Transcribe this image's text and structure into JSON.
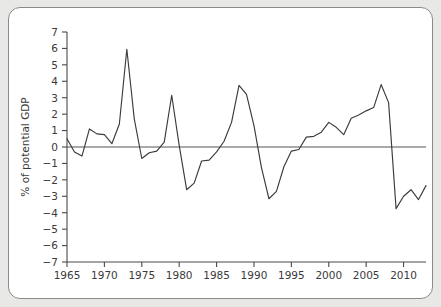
{
  "chart_data": {
    "type": "line",
    "title": "",
    "subtitle": "",
    "xlabel": "",
    "ylabel": "% of potential GDP",
    "xlim": [
      1965,
      2013
    ],
    "ylim": [
      -7,
      7
    ],
    "grid": false,
    "legend_position": "none",
    "annotations": [],
    "y_ticks": [
      7,
      6,
      5,
      4,
      3,
      2,
      1,
      0,
      -1,
      -2,
      -3,
      -4,
      -5,
      -6,
      -7
    ],
    "y_tick_labels": [
      "7",
      "6",
      "5",
      "4",
      "3",
      "2",
      "1",
      "0",
      "−1",
      "−2",
      "−3",
      "−4",
      "−5",
      "−6",
      "−7"
    ],
    "x_ticks": [
      1965,
      1970,
      1975,
      1980,
      1985,
      1990,
      1995,
      2000,
      2005,
      2010
    ],
    "x_tick_labels": [
      "1965",
      "1970",
      "1975",
      "1980",
      "1985",
      "1990",
      "1995",
      "2000",
      "2005",
      "2010"
    ],
    "x_minor_ticks": [],
    "series": [
      {
        "name": "Output gap",
        "color": "#3b3b3b",
        "x": [
          1965,
          1966,
          1967,
          1968,
          1969,
          1970,
          1971,
          1972,
          1973,
          1974,
          1975,
          1976,
          1977,
          1978,
          1979,
          1980,
          1981,
          1982,
          1983,
          1984,
          1985,
          1986,
          1987,
          1988,
          1989,
          1990,
          1991,
          1992,
          1993,
          1994,
          1995,
          1996,
          1997,
          1998,
          1999,
          2000,
          2001,
          2002,
          2003,
          2004,
          2005,
          2006,
          2007,
          2008,
          2009,
          2010,
          2011,
          2012,
          2013
        ],
        "values": [
          0.5,
          -0.3,
          -0.55,
          1.1,
          0.8,
          0.75,
          0.2,
          1.4,
          5.95,
          1.7,
          -0.7,
          -0.35,
          -0.25,
          0.3,
          3.15,
          0.1,
          -2.6,
          -2.2,
          -0.85,
          -0.8,
          -0.3,
          0.35,
          1.5,
          3.75,
          3.2,
          1.3,
          -1.25,
          -3.15,
          -2.7,
          -1.2,
          -0.25,
          -0.15,
          0.6,
          0.65,
          0.9,
          1.5,
          1.2,
          0.75,
          1.75,
          1.95,
          2.2,
          2.4,
          3.8,
          2.7,
          -3.75,
          -3.0,
          -2.6,
          -3.2,
          -2.35
        ]
      }
    ]
  },
  "figure": {
    "background_color": "#ffffff",
    "page_background_color": "#e8e8e6",
    "border_color": "#8a8a8a",
    "axis_color": "#4a4a4a",
    "line_color": "#3b3b3b"
  }
}
